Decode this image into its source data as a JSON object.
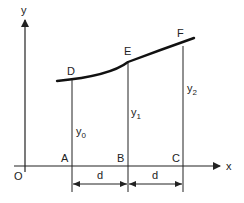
{
  "diagram": {
    "title": "",
    "axes": {
      "x_label": "x",
      "y_label": "y",
      "origin_label": "O"
    },
    "points": {
      "D": "D",
      "E": "E",
      "F": "F",
      "A": "A",
      "B": "B",
      "C": "C"
    },
    "ordinates": {
      "y0": {
        "base": "y",
        "sub": "0"
      },
      "y1": {
        "base": "y",
        "sub": "1"
      },
      "y2": {
        "base": "y",
        "sub": "2"
      }
    },
    "dimensions": {
      "d1": "d",
      "d2": "d"
    },
    "colors": {
      "line": "#222222",
      "curve": "#111111"
    }
  }
}
